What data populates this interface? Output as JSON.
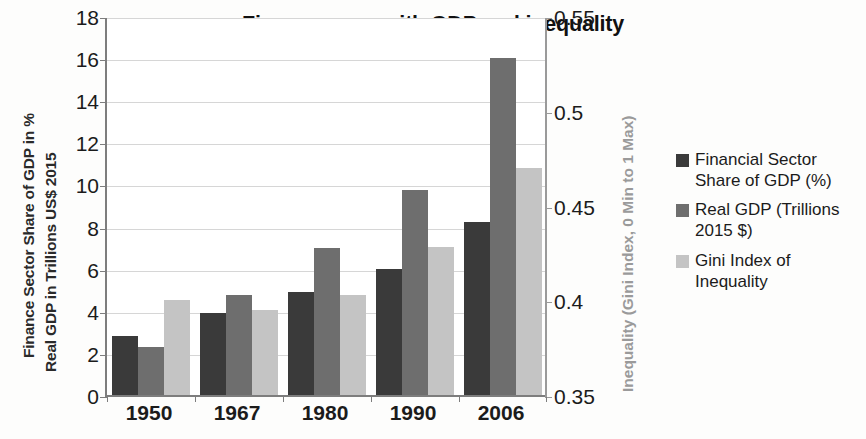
{
  "chart_data": {
    "type": "bar",
    "title": "Finance grew with GDP and inequality",
    "subtitle": "(data for USA)",
    "categories": [
      "1950",
      "1967",
      "1980",
      "1990",
      "2006"
    ],
    "series": [
      {
        "name": "Financial Sector Share of GDP (%)",
        "color": "#3a3a3a",
        "axis": "left",
        "values": [
          2.8,
          3.9,
          4.9,
          6.0,
          8.2
        ]
      },
      {
        "name": "Real GDP (Trillions 2015 $)",
        "color": "#6e6e6e",
        "axis": "left",
        "values": [
          2.3,
          4.75,
          7.0,
          9.75,
          16.0
        ]
      },
      {
        "name": "Gini Index of Inequality",
        "color": "#c4c4c4",
        "axis": "right",
        "values": [
          0.4,
          0.395,
          0.403,
          0.428,
          0.47
        ]
      }
    ],
    "left_axis": {
      "label_line1": "Finance Sector Share of GDP in %",
      "label_line2": "Real GDP in Trillions US$ 2015",
      "ticks": [
        "0",
        "2",
        "4",
        "6",
        "8",
        "10",
        "12",
        "14",
        "16",
        "18"
      ],
      "min": 0,
      "max": 18
    },
    "right_axis": {
      "label": "Inequality (Gini Index, 0 Min to 1 Max)",
      "ticks": [
        "0.35",
        "0.4",
        "0.45",
        "0.5",
        "0.55"
      ],
      "min": 0.35,
      "max": 0.55,
      "color": "#9a9a9a"
    },
    "xlabel": "",
    "grid": true,
    "legend_position": "right"
  },
  "legend": {
    "items": [
      {
        "label": "Financial Sector Share of GDP (%)",
        "color": "#3a3a3a"
      },
      {
        "label": "Real GDP (Trillions 2015 $)",
        "color": "#6e6e6e"
      },
      {
        "label": "Gini Index of Inequality",
        "color": "#c4c4c4"
      }
    ]
  }
}
